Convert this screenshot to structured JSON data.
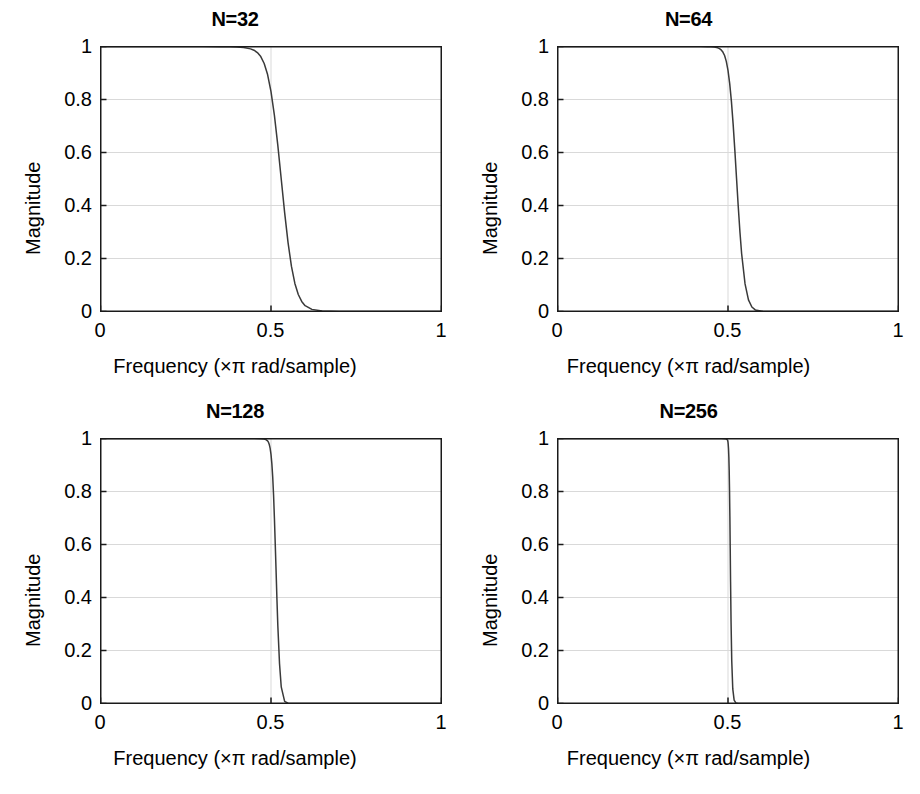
{
  "figure": {
    "background": "#ffffff",
    "line_color": "#3a3a3a",
    "axis_color": "#1a1a1a",
    "grid_color": "#d9d9d9",
    "width": 920,
    "height": 794
  },
  "chart_data": [
    {
      "type": "line",
      "title": "N=32",
      "xlabel": "Frequency (×π rad/sample)",
      "ylabel": "Magnitude",
      "xlim": [
        0,
        1
      ],
      "ylim": [
        0,
        1
      ],
      "xticks": [
        0,
        0.5,
        1
      ],
      "xticklabels": [
        "0",
        "0.5",
        "1"
      ],
      "yticks": [
        0,
        0.2,
        0.4,
        0.6,
        0.8,
        1
      ],
      "yticklabels": [
        "0",
        "0.2",
        "0.4",
        "0.6",
        "0.8",
        "1"
      ],
      "grid": true,
      "legend": "none",
      "series": [
        {
          "name": "Magnitude response",
          "x": [
            0.0,
            0.05,
            0.1,
            0.15,
            0.2,
            0.25,
            0.3,
            0.35,
            0.38,
            0.4,
            0.42,
            0.44,
            0.45,
            0.46,
            0.47,
            0.48,
            0.49,
            0.5,
            0.51,
            0.52,
            0.53,
            0.54,
            0.55,
            0.56,
            0.57,
            0.58,
            0.59,
            0.6,
            0.62,
            0.65,
            0.7,
            0.8,
            0.9,
            1.0
          ],
          "y": [
            1.0,
            1.0,
            1.0,
            1.0,
            1.0,
            1.0,
            1.0,
            0.999,
            0.999,
            0.998,
            0.996,
            0.991,
            0.986,
            0.977,
            0.962,
            0.936,
            0.894,
            0.83,
            0.74,
            0.627,
            0.5,
            0.373,
            0.26,
            0.17,
            0.106,
            0.064,
            0.038,
            0.022,
            0.008,
            0.002,
            0.0,
            0.0,
            0.0,
            0.0
          ]
        }
      ]
    },
    {
      "type": "line",
      "title": "N=64",
      "xlabel": "Frequency (×π rad/sample)",
      "ylabel": "Magnitude",
      "xlim": [
        0,
        1
      ],
      "ylim": [
        0,
        1
      ],
      "xticks": [
        0,
        0.5,
        1
      ],
      "xticklabels": [
        "0",
        "0.5",
        "1"
      ],
      "yticks": [
        0,
        0.2,
        0.4,
        0.6,
        0.8,
        1
      ],
      "yticklabels": [
        "0",
        "0.2",
        "0.4",
        "0.6",
        "0.8",
        "1"
      ],
      "grid": true,
      "legend": "none",
      "series": [
        {
          "name": "Magnitude response",
          "x": [
            0.0,
            0.1,
            0.2,
            0.3,
            0.38,
            0.42,
            0.44,
            0.45,
            0.46,
            0.47,
            0.475,
            0.48,
            0.485,
            0.49,
            0.495,
            0.5,
            0.505,
            0.51,
            0.515,
            0.52,
            0.525,
            0.53,
            0.535,
            0.54,
            0.55,
            0.56,
            0.57,
            0.58,
            0.6,
            0.65,
            0.7,
            0.8,
            0.9,
            1.0
          ],
          "y": [
            1.0,
            1.0,
            1.0,
            1.0,
            1.0,
            1.0,
            0.999,
            0.999,
            0.998,
            0.995,
            0.992,
            0.987,
            0.979,
            0.966,
            0.944,
            0.91,
            0.86,
            0.793,
            0.708,
            0.61,
            0.503,
            0.397,
            0.3,
            0.218,
            0.104,
            0.044,
            0.017,
            0.006,
            0.001,
            0.0,
            0.0,
            0.0,
            0.0,
            0.0
          ]
        }
      ]
    },
    {
      "type": "line",
      "title": "N=128",
      "xlabel": "Frequency (×π rad/sample)",
      "ylabel": "Magnitude",
      "xlim": [
        0,
        1
      ],
      "ylim": [
        0,
        1
      ],
      "xticks": [
        0,
        0.5,
        1
      ],
      "xticklabels": [
        "0",
        "0.5",
        "1"
      ],
      "yticks": [
        0,
        0.2,
        0.4,
        0.6,
        0.8,
        1
      ],
      "yticklabels": [
        "0",
        "0.2",
        "0.4",
        "0.6",
        "0.8",
        "1"
      ],
      "grid": true,
      "legend": "none",
      "series": [
        {
          "name": "Magnitude response",
          "x": [
            0.0,
            0.1,
            0.2,
            0.3,
            0.4,
            0.45,
            0.47,
            0.48,
            0.485,
            0.49,
            0.4925,
            0.495,
            0.4975,
            0.5,
            0.5025,
            0.505,
            0.5075,
            0.51,
            0.5125,
            0.515,
            0.5175,
            0.52,
            0.525,
            0.53,
            0.54,
            0.55,
            0.6,
            0.7,
            0.8,
            0.9,
            1.0
          ],
          "y": [
            1.0,
            1.0,
            1.0,
            1.0,
            1.0,
            1.0,
            0.999,
            0.998,
            0.996,
            0.991,
            0.986,
            0.977,
            0.963,
            0.94,
            0.905,
            0.855,
            0.787,
            0.7,
            0.6,
            0.495,
            0.39,
            0.294,
            0.15,
            0.063,
            0.008,
            0.001,
            0.0,
            0.0,
            0.0,
            0.0,
            0.0
          ]
        }
      ]
    },
    {
      "type": "line",
      "title": "N=256",
      "xlabel": "Frequency (×π rad/sample)",
      "ylabel": "Magnitude",
      "xlim": [
        0,
        1
      ],
      "ylim": [
        0,
        1
      ],
      "xticks": [
        0,
        0.5,
        1
      ],
      "xticklabels": [
        "0",
        "0.5",
        "1"
      ],
      "yticks": [
        0,
        0.2,
        0.4,
        0.6,
        0.8,
        1
      ],
      "yticklabels": [
        "0",
        "0.2",
        "0.4",
        "0.6",
        "0.8",
        "1"
      ],
      "grid": true,
      "legend": "none",
      "series": [
        {
          "name": "Magnitude response",
          "x": [
            0.0,
            0.1,
            0.2,
            0.3,
            0.4,
            0.45,
            0.48,
            0.49,
            0.495,
            0.4975,
            0.499,
            0.5,
            0.5005,
            0.5015,
            0.5025,
            0.5035,
            0.5045,
            0.5055,
            0.5065,
            0.5075,
            0.509,
            0.511,
            0.514,
            0.518,
            0.523,
            0.53,
            0.55,
            0.6,
            0.7,
            0.8,
            0.9,
            1.0
          ],
          "y": [
            1.0,
            1.0,
            1.0,
            1.0,
            1.0,
            1.0,
            1.0,
            0.999,
            0.998,
            0.996,
            0.993,
            0.986,
            0.98,
            0.962,
            0.93,
            0.88,
            0.805,
            0.705,
            0.585,
            0.46,
            0.305,
            0.16,
            0.055,
            0.013,
            0.002,
            0.0,
            0.0,
            0.0,
            0.0,
            0.0,
            0.0,
            0.0
          ]
        }
      ]
    }
  ]
}
